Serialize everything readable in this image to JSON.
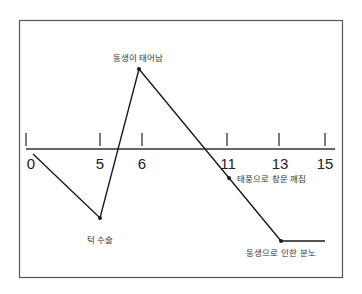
{
  "diagram": {
    "type": "life-event-timeline",
    "axis": {
      "ticks": [
        {
          "label": "0",
          "x": 26
        },
        {
          "label": "5",
          "x": 100
        },
        {
          "label": "6",
          "x": 142
        },
        {
          "label": "11",
          "x": 227
        },
        {
          "label": "13",
          "x": 279
        },
        {
          "label": "15",
          "x": 325
        }
      ]
    },
    "events": [
      {
        "label": "턱 수술",
        "age": 5,
        "direction": "negative"
      },
      {
        "label": "동생이 태어남",
        "age": 6,
        "direction": "positive"
      },
      {
        "label": "태풍으로 창문 깨짐",
        "age": 11,
        "direction": "negative"
      },
      {
        "label": "동생으로 인한 분노",
        "age": 13,
        "direction": "negative"
      }
    ],
    "colors": {
      "line": "#1a1a1a",
      "frame": "#555555",
      "background": "#ffffff"
    }
  }
}
